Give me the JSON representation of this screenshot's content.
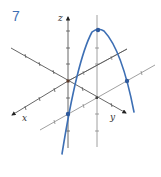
{
  "figure": {
    "problem_number": "7",
    "axes": {
      "x_label": "x",
      "y_label": "y",
      "z_label": "z"
    },
    "colors": {
      "curve": "#3d6fb4",
      "axes": "#555555",
      "grid": "#888888",
      "label": "#3d6fb4",
      "point": "#2f5a9c"
    }
  }
}
